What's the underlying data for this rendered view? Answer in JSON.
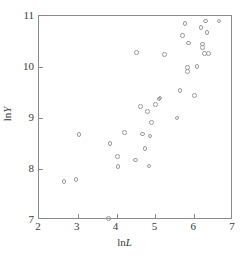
{
  "chart_data": {
    "type": "scatter",
    "title": "",
    "xlabel": "lnL",
    "ylabel": "lnY",
    "xlabel_parts": {
      "prefix": "ln",
      "variable": "L"
    },
    "ylabel_parts": {
      "prefix": "ln",
      "variable": "Y"
    },
    "xlim": [
      2,
      7
    ],
    "ylim": [
      7,
      11
    ],
    "xticks": [
      2,
      3,
      4,
      5,
      6,
      7
    ],
    "xtick_labels": [
      "2",
      "3",
      "4",
      "5",
      "6",
      "7"
    ],
    "yticks": [
      7,
      8,
      9,
      10,
      11
    ],
    "ytick_labels": [
      "7",
      "8",
      "9",
      "10",
      "11"
    ],
    "grid": false,
    "legend": null,
    "marker": "open-circle",
    "marker_color": "#9a9a9a",
    "frame_color": "#8a8a8a",
    "series": [
      {
        "name": "observations",
        "points": [
          [
            2.64,
            7.75
          ],
          [
            2.95,
            7.79
          ],
          [
            3.03,
            8.68
          ],
          [
            3.79,
            7.03
          ],
          [
            3.83,
            8.5
          ],
          [
            4.03,
            8.25
          ],
          [
            4.04,
            8.05
          ],
          [
            4.2,
            8.71
          ],
          [
            4.48,
            8.18
          ],
          [
            4.52,
            10.29
          ],
          [
            4.62,
            9.22
          ],
          [
            4.67,
            8.69
          ],
          [
            4.73,
            8.4
          ],
          [
            4.8,
            9.13
          ],
          [
            4.83,
            8.06
          ],
          [
            4.86,
            8.65
          ],
          [
            4.9,
            8.91
          ],
          [
            5.0,
            9.27
          ],
          [
            5.09,
            9.37
          ],
          [
            5.12,
            9.39
          ],
          [
            5.23,
            10.25
          ],
          [
            5.56,
            9.0
          ],
          [
            5.63,
            9.54
          ],
          [
            5.7,
            10.62
          ],
          [
            5.76,
            10.85
          ],
          [
            5.82,
            9.99
          ],
          [
            5.83,
            9.91
          ],
          [
            5.85,
            10.47
          ],
          [
            6.01,
            9.44
          ],
          [
            6.07,
            10.01
          ],
          [
            6.18,
            10.78
          ],
          [
            6.21,
            10.45
          ],
          [
            6.22,
            10.38
          ],
          [
            6.26,
            10.26
          ],
          [
            6.29,
            10.9
          ],
          [
            6.33,
            10.68
          ],
          [
            6.37,
            10.26
          ],
          [
            6.64,
            10.9
          ]
        ]
      }
    ]
  }
}
